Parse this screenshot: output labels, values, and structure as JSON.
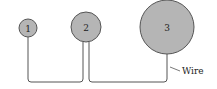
{
  "diagram": {
    "spheres": [
      {
        "label": "1",
        "cx": 28,
        "cy": 28,
        "r": 9
      },
      {
        "label": "2",
        "cx": 86,
        "cy": 27,
        "r": 15
      },
      {
        "label": "3",
        "cx": 167,
        "cy": 27,
        "r": 27
      }
    ],
    "wire_label": "Wire",
    "colors": {
      "sphere_fill": "#b5b5b5",
      "stroke": "#555555",
      "background": "#ffffff"
    }
  }
}
